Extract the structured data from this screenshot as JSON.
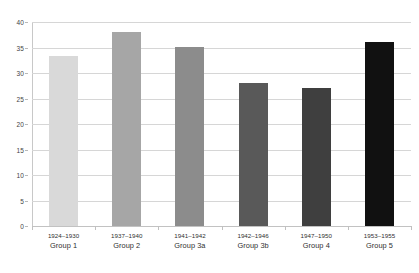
{
  "chart_data": {
    "type": "bar",
    "title": "",
    "subtitle": "",
    "xlabel": "",
    "ylabel": "",
    "ylim": [
      0,
      40
    ],
    "ytick_step": 5,
    "yticks": [
      "0",
      "5",
      "10",
      "15",
      "20",
      "25",
      "30",
      "35",
      "40"
    ],
    "grid": true,
    "legend": "none",
    "categories": [
      "1924–1930\nGroup 1",
      "1937–1940\nGroup 2",
      "1941–1942\nGroup 3a",
      "1942–1946\nGroup 3b",
      "1947–1950\nGroup 4",
      "1953–1955\nGroup 5"
    ],
    "values": [
      33.3,
      38.0,
      35.0,
      28.0,
      27.0,
      36.0
    ],
    "bars": [
      {
        "years": "1924–1930",
        "group": "Group 1",
        "value": 33.3,
        "color": "#d9d9d9"
      },
      {
        "years": "1937–1940",
        "group": "Group 2",
        "value": 38.0,
        "color": "#a6a6a6"
      },
      {
        "years": "1941–1942",
        "group": "Group 3a",
        "value": 35.0,
        "color": "#8c8c8c"
      },
      {
        "years": "1942–1946",
        "group": "Group 3b",
        "value": 28.0,
        "color": "#595959"
      },
      {
        "years": "1947–1950",
        "group": "Group 4",
        "value": 27.0,
        "color": "#3f3f3f"
      },
      {
        "years": "1953–1955",
        "group": "Group 5",
        "value": 36.0,
        "color": "#111111"
      }
    ],
    "colors": {
      "gridline": "#d6d6d6",
      "axis": "#c2c2c2",
      "background": "#ffffff",
      "text": "#3f3f3f"
    }
  }
}
